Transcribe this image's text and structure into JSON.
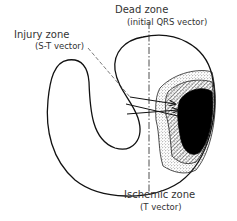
{
  "diagram": {
    "type": "anatomical-schematic",
    "labels": {
      "dead_zone": {
        "title": "Dead zone",
        "subtitle": "(initial QRS vector)"
      },
      "injury_zone": {
        "title": "Injury zone",
        "subtitle": "(S-T vector)"
      },
      "ischemic_zone": {
        "title": "Ischemic zone",
        "subtitle": "(T vector)"
      }
    },
    "regions": [
      {
        "name": "dead-zone",
        "fill": "#000000",
        "pattern": "solid"
      },
      {
        "name": "injury-zone",
        "fill": "#ffffff",
        "pattern": "diagonal-hatch"
      },
      {
        "name": "ischemic-zone",
        "fill": "#ffffff",
        "pattern": "stipple"
      }
    ],
    "vectors": {
      "count": 3,
      "direction": "away from infarct (leftward)"
    },
    "colors": {
      "stroke": "#111111",
      "text": "#333333",
      "background": "#ffffff"
    }
  }
}
